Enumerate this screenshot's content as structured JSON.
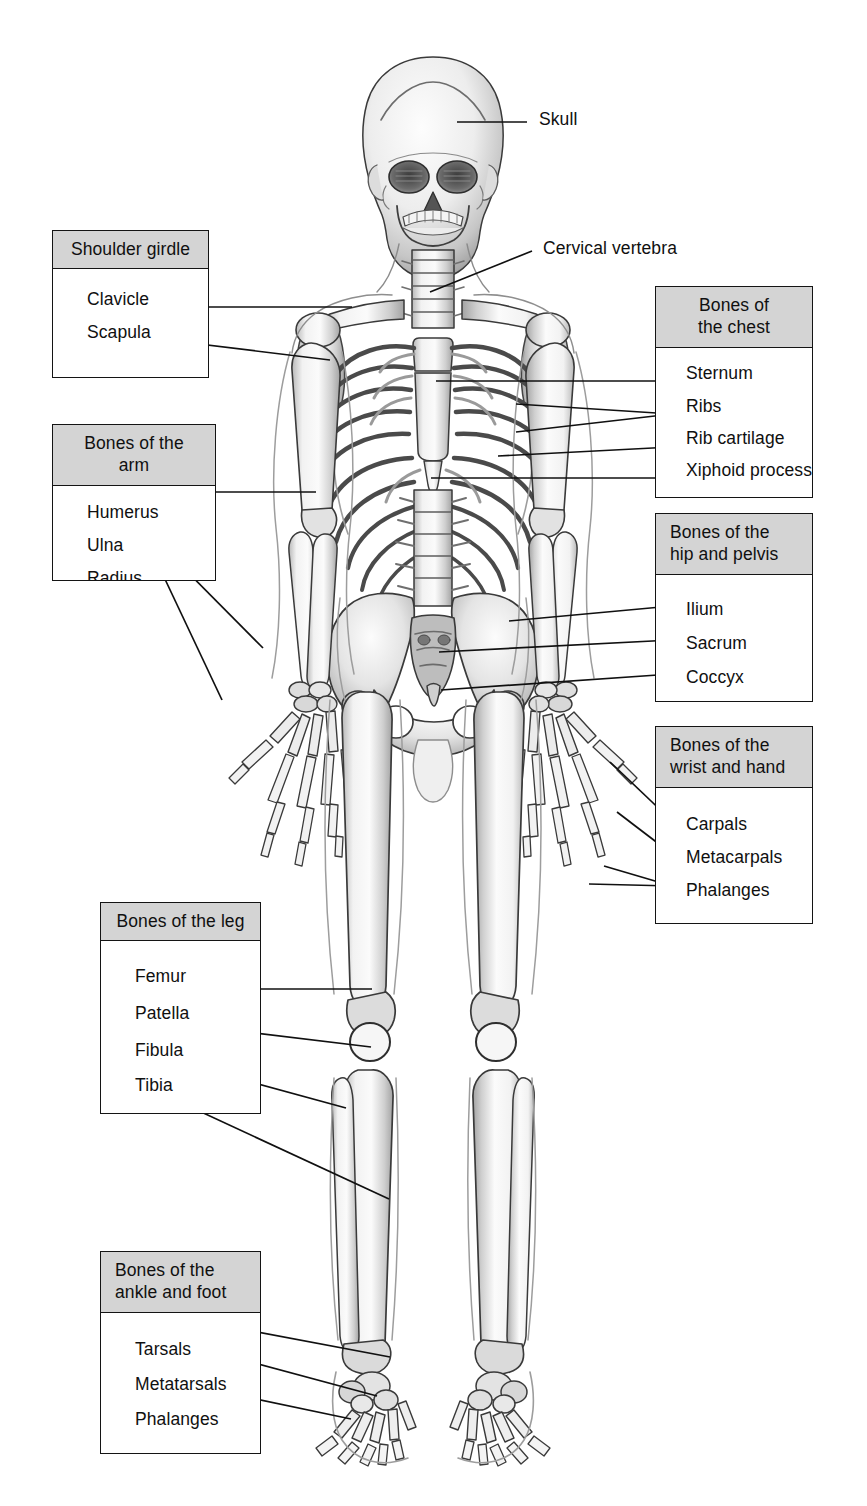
{
  "figure": {
    "background_color": "#ffffff",
    "line_color": "#141414",
    "header_fill": "#d4d4d4",
    "text_color": "#101010"
  },
  "free_labels": [
    {
      "id": "skull",
      "text": "Skull"
    },
    {
      "id": "cervical-vertebra",
      "text": "Cervical vertebra"
    }
  ],
  "callouts": [
    {
      "id": "shoulder-girdle",
      "title": "Shoulder girdle",
      "title_align": "center",
      "items": [
        {
          "text": "Clavicle"
        },
        {
          "text": "Scapula"
        }
      ]
    },
    {
      "id": "bones-of-the-arm",
      "title": "Bones of the arm",
      "title_align": "center",
      "items": [
        {
          "text": "Humerus"
        },
        {
          "text": "Ulna"
        },
        {
          "text": "Radius"
        }
      ]
    },
    {
      "id": "bones-of-the-chest",
      "title": "Bones of\nthe chest",
      "title_align": "center",
      "items": [
        {
          "text": "Sternum"
        },
        {
          "text": "Ribs"
        },
        {
          "text": "Rib cartilage"
        },
        {
          "text": "Xiphoid process"
        }
      ]
    },
    {
      "id": "bones-of-the-hip-and-pelvis",
      "title": "Bones of the\nhip and pelvis",
      "title_align": "left",
      "items": [
        {
          "text": "Ilium"
        },
        {
          "text": "Sacrum"
        },
        {
          "text": "Coccyx"
        }
      ]
    },
    {
      "id": "bones-of-the-wrist-and-hand",
      "title": "Bones of the\nwrist and hand",
      "title_align": "left",
      "items": [
        {
          "text": "Carpals"
        },
        {
          "text": "Metacarpals"
        },
        {
          "text": "Phalanges"
        }
      ]
    },
    {
      "id": "bones-of-the-leg",
      "title": "Bones of the leg",
      "title_align": "center",
      "items": [
        {
          "text": "Femur"
        },
        {
          "text": "Patella"
        },
        {
          "text": "Fibula"
        },
        {
          "text": "Tibia"
        }
      ]
    },
    {
      "id": "bones-of-the-ankle-and-foot",
      "title": "Bones of the\nankle and foot",
      "title_align": "left",
      "items": [
        {
          "text": "Tarsals"
        },
        {
          "text": "Metatarsals"
        },
        {
          "text": "Phalanges"
        }
      ]
    }
  ]
}
